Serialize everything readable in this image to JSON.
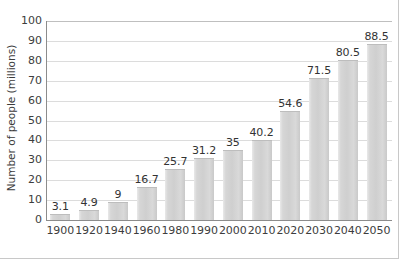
{
  "chart_data": {
    "type": "bar",
    "title": "",
    "xlabel": "",
    "ylabel": "Number of people (millions)",
    "categories": [
      "1900",
      "1920",
      "1940",
      "1960",
      "1980",
      "1990",
      "2000",
      "2010",
      "2020",
      "2030",
      "2040",
      "2050"
    ],
    "values": [
      3.1,
      4.9,
      9,
      16.7,
      25.7,
      31.2,
      35,
      40.2,
      54.6,
      71.5,
      80.5,
      88.5
    ],
    "value_labels": [
      "3.1",
      "4.9",
      "9",
      "16.7",
      "25.7",
      "31.2",
      "35",
      "40.2",
      "54.6",
      "71.5",
      "80.5",
      "88.5"
    ],
    "ylim": [
      0,
      100
    ],
    "ytick_labels": [
      "0",
      "10",
      "20",
      "30",
      "40",
      "50",
      "60",
      "70",
      "80",
      "90",
      "100"
    ],
    "ytick_values": [
      0,
      10,
      20,
      30,
      40,
      50,
      60,
      70,
      80,
      90,
      100
    ],
    "grid": true,
    "legend": false,
    "legend_position": "none",
    "bar_color": "#d4d4d4",
    "grid_color": "#dcdcdc",
    "axis_color": "#8c8c8c",
    "text_color": "#3d3d3d"
  }
}
